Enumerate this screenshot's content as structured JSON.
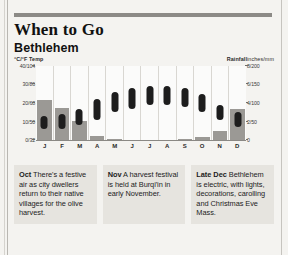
{
  "header": {
    "title": "When to Go",
    "subtitle": "Bethlehem"
  },
  "chart_data": {
    "type": "bar",
    "categories": [
      "J",
      "F",
      "M",
      "A",
      "M",
      "J",
      "J",
      "A",
      "S",
      "O",
      "N",
      "D"
    ],
    "left_axis": {
      "label": "°C/°F Temp",
      "ticks": [
        "40/104",
        "30/86",
        "20/68",
        "10/50",
        "0/32"
      ],
      "values_c": [
        40,
        30,
        20,
        10,
        0
      ],
      "ylim": [
        0,
        40
      ]
    },
    "right_axis": {
      "label": "Rainfall",
      "unit": "inches/mm",
      "ticks": [
        "8/200",
        "6/150",
        "4/100",
        "2/50",
        "0"
      ],
      "values_in": [
        8,
        6,
        4,
        2,
        0
      ],
      "ylim": [
        0,
        8
      ]
    },
    "grid": false,
    "legend": "none",
    "series": [
      {
        "name": "Temperature range (°C)",
        "type": "range-bar",
        "color": "#1d1d1d",
        "min": [
          6,
          6,
          8,
          11,
          15,
          17,
          19,
          19,
          18,
          15,
          11,
          7
        ],
        "max": [
          13,
          14,
          17,
          22,
          26,
          28,
          29,
          29,
          28,
          25,
          19,
          15
        ]
      },
      {
        "name": "Rainfall (inches)",
        "type": "bar",
        "color": "#9b9995",
        "values": [
          4.3,
          3.5,
          2.1,
          0.4,
          0.1,
          0.0,
          0.0,
          0.0,
          0.1,
          0.3,
          1.0,
          3.3
        ]
      }
    ]
  },
  "notes": [
    {
      "month": "Oct",
      "text": " There's a festive air as city dwellers return to their native villages for the olive harvest."
    },
    {
      "month": "Nov",
      "text": " A harvest festival is held at Burqi'in in early November."
    },
    {
      "month": "Late Dec",
      "text": " Bethlehem is electric, with lights, decorations, carolling and Christmas Eve Mass."
    }
  ]
}
